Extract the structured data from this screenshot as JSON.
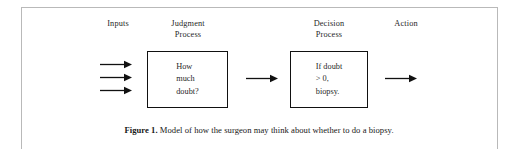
{
  "figure": {
    "frame_color": "#b9b9b9",
    "box_border_color": "#111111",
    "text_color": "#1f1f1f",
    "background": "#ffffff"
  },
  "headers": {
    "inputs": "Inputs",
    "judgment_process": "Judgment\nProcess",
    "decision_process": "Decision\nProcess",
    "action": "Action"
  },
  "boxes": {
    "judgment": {
      "text": "How\nmuch\ndoubt?"
    },
    "decision": {
      "text": "If doubt\n> 0,\nbiopsy."
    }
  },
  "arrows": {
    "input_1": "arrow-right",
    "input_2": "arrow-right",
    "input_3": "arrow-right",
    "judgment_to_decision": "arrow-right",
    "decision_to_action": "arrow-right"
  },
  "caption": {
    "label": "Figure 1.",
    "text": " Model of how the surgeon may think about whether to do a biopsy."
  }
}
